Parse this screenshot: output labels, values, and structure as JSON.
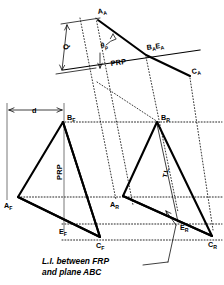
{
  "figure": {
    "background_color": "#ffffff",
    "ink_color": "#000000"
  },
  "auxiliary_view": {
    "name": "auxiliary-view",
    "points": [
      {
        "id": "A_A",
        "label": "A",
        "subscript": "A",
        "x": 100,
        "y": 16
      },
      {
        "id": "B_A_E_A",
        "label": "B",
        "subscript": "A",
        "label2": "E",
        "subscript2": "A",
        "x": 150,
        "y": 52
      },
      {
        "id": "C_A",
        "label": "C",
        "subscript": "A",
        "x": 193,
        "y": 72
      }
    ],
    "dimensions": [
      {
        "name": "Q",
        "label": "Q"
      }
    ],
    "angle_label": {
      "name": "theta-p",
      "glyph": "θ",
      "subscript": "p"
    },
    "reference_plane_label": "PRP"
  },
  "front_view": {
    "name": "front-view",
    "points": [
      {
        "id": "A_F",
        "label": "A",
        "subscript": "F"
      },
      {
        "id": "B_F",
        "label": "B",
        "subscript": "F"
      },
      {
        "id": "C_F",
        "label": "C",
        "subscript": "F"
      },
      {
        "id": "E_F",
        "label": "E",
        "subscript": "F"
      }
    ],
    "dimensions": [
      {
        "name": "d",
        "label": "d"
      }
    ],
    "reference_plane_label": "PRP"
  },
  "right_view": {
    "name": "right-side-view",
    "points": [
      {
        "id": "A_R",
        "label": "A",
        "subscript": "R"
      },
      {
        "id": "B_R",
        "label": "B",
        "subscript": "R"
      },
      {
        "id": "C_R",
        "label": "C",
        "subscript": "R"
      },
      {
        "id": "E_R",
        "label": "E",
        "subscript": "R"
      }
    ],
    "true_length_label": "T.L."
  },
  "caption": {
    "name": "line-of-intersection-caption",
    "line1": "L.I. between FRP",
    "line2": "and plane ABC"
  }
}
